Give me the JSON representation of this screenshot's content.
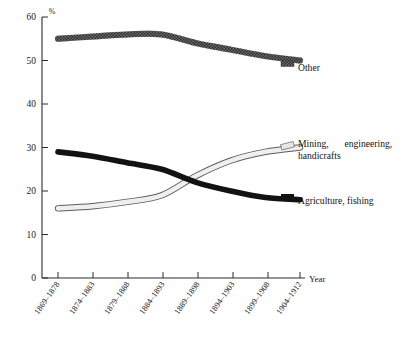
{
  "chart_data": {
    "type": "line",
    "title": "",
    "subtitle": "",
    "xlabel": "Year",
    "ylabel": "%",
    "ylim": [
      0,
      60
    ],
    "yticks": [
      0,
      10,
      20,
      30,
      40,
      50,
      60
    ],
    "grid": false,
    "legend_position": "right-inline",
    "categories": [
      "1869–1878",
      "1874–1883",
      "1879–1888",
      "1884–1893",
      "1889–1898",
      "1894–1903",
      "1899–1908",
      "1904–1912"
    ],
    "series": [
      {
        "name": "Other",
        "style": "dark-speckled-band",
        "color": "#4a4a4a",
        "values": [
          55,
          55.5,
          56,
          56,
          54,
          52.5,
          51,
          50
        ]
      },
      {
        "name": "Agriculture, fishing",
        "style": "solid-black-band",
        "color": "#121212",
        "values": [
          29,
          28,
          26.5,
          25,
          22,
          20,
          18.5,
          18
        ]
      },
      {
        "name": "Mining, engineering, handicrafts",
        "style": "light-outlined-band",
        "color": "#e8e8e8",
        "values": [
          16,
          16.5,
          17.5,
          19,
          23.5,
          27,
          29,
          30
        ]
      }
    ]
  },
  "axes": {
    "y_unit_symbol": "%",
    "x_axis_title": "Year"
  },
  "annotations": {
    "label_other": "Other",
    "label_mining_line1": "Mining,",
    "label_mining_line2": "engineering,",
    "label_mining_line3": "handicrafts",
    "label_agriculture": "Agriculture, fishing"
  },
  "colors": {
    "other": "#4a4a4a",
    "agriculture": "#121212",
    "mining": "#e8e8e8",
    "axis": "#2b2b2b",
    "background": "#ffffff"
  }
}
